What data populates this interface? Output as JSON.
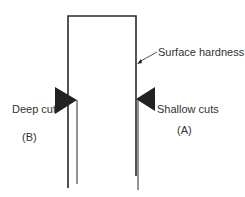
{
  "diagram": {
    "labels": {
      "surface_hardness": "Surface hardness",
      "deep_cut": "Deep cut",
      "shallow_cuts": "Shallow cuts",
      "b": "(B)",
      "a": "(A)"
    },
    "colors": {
      "ink": "#2a2a2a",
      "background": "#ffffff"
    }
  }
}
